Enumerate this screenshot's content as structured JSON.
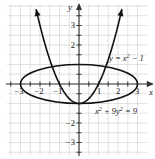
{
  "chart_data": {
    "type": "line",
    "title": "",
    "xlabel": "x",
    "ylabel": "y",
    "xlim": [
      -3.6,
      3.5
    ],
    "ylim": [
      -3.6,
      3.9
    ],
    "grid": true,
    "grid_step": 0.5,
    "x_ticks": [
      -3,
      -2,
      -1,
      1,
      2,
      3
    ],
    "x_tick_labels": [
      "−3",
      "−2",
      "−1",
      "1",
      "2",
      "3"
    ],
    "y_ticks": [
      -3,
      -2,
      -1,
      2,
      3
    ],
    "y_tick_labels": [
      "−3",
      "−2",
      "−1",
      "2",
      "3"
    ],
    "series": [
      {
        "name": "parabola",
        "equation": "y = x^2 − 1",
        "label": "y = x² − 1",
        "x_range": [
          -2.2,
          2.2
        ],
        "arrows": true
      },
      {
        "name": "ellipse",
        "equation": "x^2 + 9y^2 = 9",
        "label": "x² + 9y² = 9",
        "semi_major_x": 3,
        "semi_minor_y": 1
      }
    ],
    "annotations": [
      {
        "text": "y = x² − 1",
        "near": [
          1.6,
          1.3
        ]
      },
      {
        "text": "x² + 9y² = 9",
        "near": [
          1.6,
          -1.4
        ]
      }
    ]
  },
  "labels": {
    "x_axis": "x",
    "y_axis": "y",
    "parabola_lhs": "y = x",
    "parabola_rhs": " − 1",
    "ellipse_a": "x",
    "ellipse_b": " + 9y",
    "ellipse_c": " = 9",
    "sup2": "2",
    "xt_m3": "−3",
    "xt_m2": "−2",
    "xt_m1": "−1",
    "xt_1": "1",
    "xt_2": "2",
    "xt_3": "3",
    "yt_3": "3",
    "yt_2": "2",
    "yt_m1": "−1",
    "yt_m2": "−2",
    "yt_m3": "−3"
  }
}
